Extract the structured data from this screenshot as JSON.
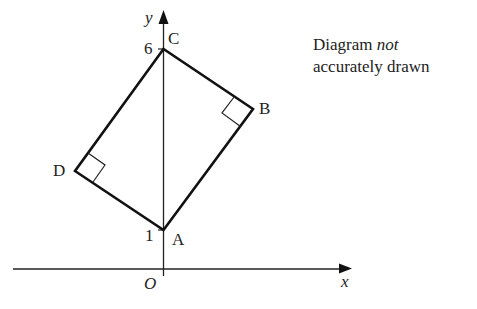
{
  "note": {
    "line1_prefix": "Diagram ",
    "line1_italic": "not",
    "line2": "accurately drawn"
  },
  "axes": {
    "x_label": "x",
    "y_label": "y",
    "origin_label": "O",
    "y_ticks": [
      "6",
      "1"
    ]
  },
  "points": {
    "A": "A",
    "B": "B",
    "C": "C",
    "D": "D"
  },
  "colors": {
    "stroke": "#111111",
    "background": "#ffffff"
  }
}
